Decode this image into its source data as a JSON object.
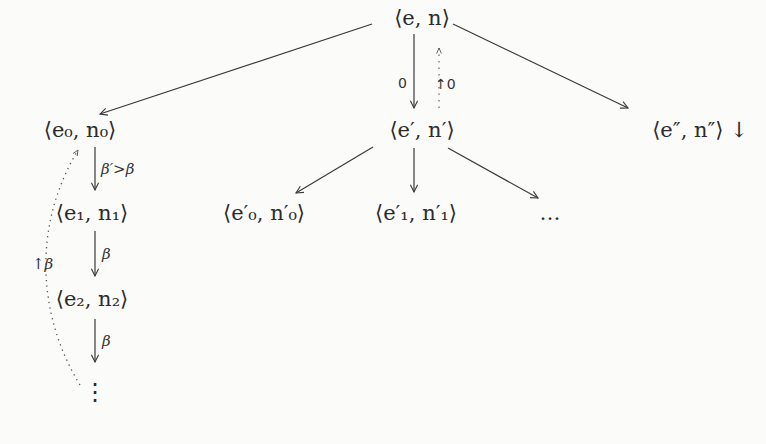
{
  "diagram": {
    "type": "search-tree",
    "nodes": {
      "root": "⟨e, n⟩",
      "left": "⟨e₀, n₀⟩",
      "middle": "⟨e′, n′⟩",
      "right": "⟨e″, n″⟩ ↓",
      "mid_child_0": "⟨e′₀, n′₀⟩",
      "mid_child_1": "⟨e′₁, n′₁⟩",
      "mid_child_more": "…",
      "chain_1": "⟨e₁, n₁⟩",
      "chain_2": "⟨e₂, n₂⟩",
      "chain_more": "⋮"
    },
    "edge_labels": {
      "root_to_middle": "0",
      "middle_back_to_root": "↑0",
      "left_to_chain1": "β′>β",
      "chain1_to_chain2": "β",
      "chain2_to_more": "β",
      "chain_back_to_left": "↑β"
    },
    "colors": {
      "ink": "#2b2b2b",
      "background": "#fbfbfa"
    }
  }
}
